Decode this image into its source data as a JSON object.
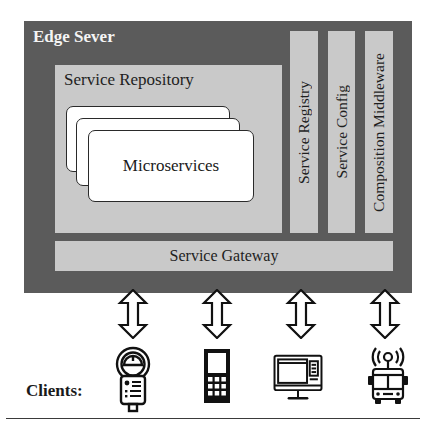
{
  "diagram": {
    "server": {
      "title": "Edge Sever",
      "color": "#5b5b5b"
    },
    "repository": {
      "title": "Service Repository",
      "color": "#c9c9c9",
      "stack": {
        "label": "Microservices",
        "card_count": 3
      }
    },
    "side_modules": [
      {
        "label": "Service Registry"
      },
      {
        "label": "Service Config"
      },
      {
        "label": "Composition Middleware"
      }
    ],
    "gateway": {
      "label": "Service Gateway"
    },
    "connections": {
      "type": "bidirectional-arrow",
      "count": 4
    },
    "clients": {
      "label": "Clients:",
      "items": [
        {
          "name": "parking-meter",
          "icon": "parking-meter-icon"
        },
        {
          "name": "mobile-phone",
          "icon": "mobile-phone-icon"
        },
        {
          "name": "desktop-computer",
          "icon": "desktop-computer-icon"
        },
        {
          "name": "connected-bus",
          "icon": "connected-bus-icon"
        }
      ]
    }
  }
}
